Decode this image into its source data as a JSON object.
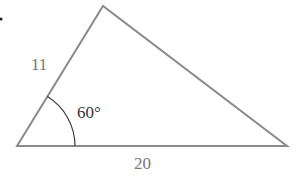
{
  "figure": {
    "type": "triangle",
    "vertices": {
      "left": [
        17,
        146
      ],
      "apex": [
        103,
        6
      ],
      "right": [
        287,
        146
      ]
    },
    "bullet": [
      1,
      19
    ],
    "sides": [
      {
        "name": "left-side",
        "label": "11",
        "pos": [
          31,
          70
        ]
      },
      {
        "name": "base",
        "label": "20",
        "pos": [
          134,
          169
        ]
      }
    ],
    "angle": {
      "label": "60°",
      "pos": [
        77,
        118
      ],
      "arc_radius": 58
    },
    "colors": {
      "line": "#8a8a8a",
      "arc": "#3a3a3a",
      "angle_text": "#333333",
      "side_text": "#777777",
      "bullet": "#222222"
    }
  }
}
